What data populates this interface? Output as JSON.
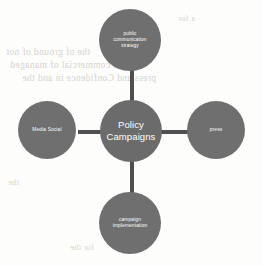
{
  "diagram": {
    "type": "hub-and-spoke",
    "center": {
      "id": "policy-campaigns",
      "label": "Policy\nCampaigns",
      "line1": "Policy",
      "line2": "Campaigns"
    },
    "nodes": [
      {
        "id": "public-communication-strategy",
        "position": "top",
        "label": "public communication strategy",
        "line1": "public",
        "line2": "communication",
        "line3": "strategy"
      },
      {
        "id": "media-social",
        "position": "left",
        "label": "Media Social",
        "line1": "Media Social",
        "line2": "",
        "line3": ""
      },
      {
        "id": "press",
        "position": "right",
        "label": "press",
        "line1": "press",
        "line2": "",
        "line3": ""
      },
      {
        "id": "campaign-implementation",
        "position": "bottom",
        "label": "campaign implementation",
        "line1": "campaign",
        "line2": "implementation",
        "line3": ""
      }
    ],
    "connectors": [
      {
        "id": "connector-top",
        "from": "policy-campaigns",
        "to": "public-communication-strategy",
        "orientation": "vertical"
      },
      {
        "id": "connector-bottom",
        "from": "policy-campaigns",
        "to": "campaign-implementation",
        "orientation": "vertical"
      },
      {
        "id": "connector-left",
        "from": "policy-campaigns",
        "to": "media-social",
        "orientation": "horizontal"
      },
      {
        "id": "connector-right",
        "from": "policy-campaigns",
        "to": "press",
        "orientation": "horizontal"
      }
    ],
    "colors": {
      "background": "#fdfdfc",
      "node_fill": "#6f6f6f",
      "center_fill": "#6b6b6b",
      "connector": "#4f4f4f",
      "node_text": "#ffffff",
      "bleed_through_text": "#c9c6c0"
    }
  },
  "page": {
    "bleed_through": {
      "note": "faint mirrored text showing through from the reverse side of the scanned page",
      "lines": [
        "the of  ground  of  not",
        "in  a  commercial  of  managed",
        "press  and  Confidence  in  and  the",
        "a  for",
        "the",
        "for  the"
      ]
    }
  }
}
